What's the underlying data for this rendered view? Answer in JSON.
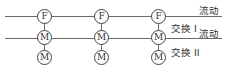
{
  "diagram": {
    "lines": [
      {
        "name": "flow-line-top",
        "y": 16
      },
      {
        "name": "flow-line-middle",
        "y": 38
      }
    ],
    "columns": [
      {
        "x": 44,
        "nodes": [
          "F",
          "M",
          "M"
        ]
      },
      {
        "x": 101,
        "nodes": [
          "F",
          "M",
          "M"
        ]
      },
      {
        "x": 158,
        "nodes": [
          "F",
          "M",
          "M"
        ]
      }
    ],
    "labels": {
      "flow_top": "流动",
      "exchange_1": "交换 I",
      "flow_middle": "流动",
      "exchange_2": "交换 II"
    },
    "colors": {
      "line": "#6a6a6a",
      "node_border": "#444444",
      "text": "#333333"
    }
  }
}
